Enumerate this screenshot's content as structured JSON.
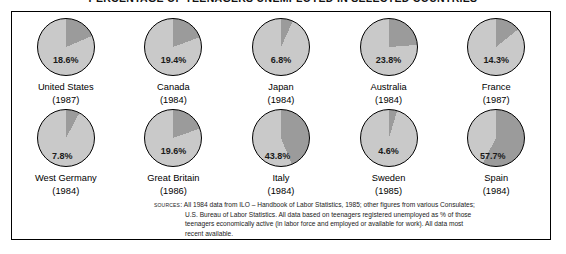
{
  "title": "PERCENTAGE OF TEENAGERS UNEMPLOYED IN SELECTED COUNTRIES",
  "sources": {
    "label": "Sources:",
    "line1": "All 1984 data from ILO – Handbook of Labor Statistics, 1985; other figures from various Consulates;",
    "line2": "U.S. Bureau of Labor Statistics. All data based on teenagers registered unemployed as % of those",
    "line3": "teenagers economically active (in labor force and employed or available for work). All data most",
    "line4": "recent available."
  },
  "colors": {
    "pie_base": "#c9c9c9",
    "pie_slice": "#9b9b9b",
    "outline": "#000000",
    "background": "#ffffff"
  },
  "chart_data": {
    "type": "pie",
    "title": "PERCENTAGE OF TEENAGERS UNEMPLOYED IN SELECTED COUNTRIES",
    "unit": "percent",
    "slice_label_suffix": "%",
    "categories": [
      "United States",
      "Canada",
      "Japan",
      "Australia",
      "France",
      "West Germany",
      "Great Britain",
      "Italy",
      "Sweden",
      "Spain"
    ],
    "values": [
      18.6,
      19.4,
      6.8,
      23.8,
      14.3,
      7.8,
      19.6,
      43.8,
      4.6,
      57.7
    ],
    "years": [
      "1987",
      "1984",
      "1984",
      "1984",
      "1987",
      "1984",
      "1986",
      "1984",
      "1985",
      "1984"
    ],
    "items": [
      {
        "country": "United States",
        "year": "1987",
        "value": 18.6,
        "label": "18.6%"
      },
      {
        "country": "Canada",
        "year": "1984",
        "value": 19.4,
        "label": "19.4%"
      },
      {
        "country": "Japan",
        "year": "1984",
        "value": 6.8,
        "label": "6.8%"
      },
      {
        "country": "Australia",
        "year": "1984",
        "value": 23.8,
        "label": "23.8%"
      },
      {
        "country": "France",
        "year": "1987",
        "value": 14.3,
        "label": "14.3%"
      },
      {
        "country": "West Germany",
        "year": "1984",
        "value": 7.8,
        "label": "7.8%"
      },
      {
        "country": "Great Britain",
        "year": "1986",
        "value": 19.6,
        "label": "19.6%"
      },
      {
        "country": "Italy",
        "year": "1984",
        "value": 43.8,
        "label": "43.8%"
      },
      {
        "country": "Sweden",
        "year": "1985",
        "value": 4.6,
        "label": "4.6%"
      },
      {
        "country": "Spain",
        "year": "1984",
        "value": 57.7,
        "label": "57.7%"
      }
    ]
  }
}
